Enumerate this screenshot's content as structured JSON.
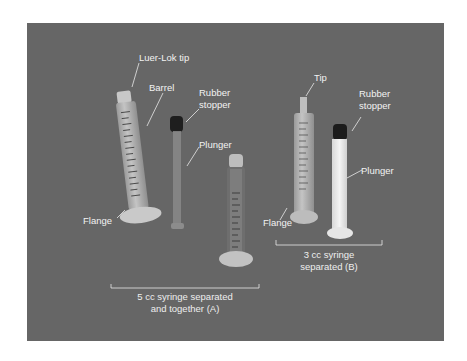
{
  "figure": {
    "background_color": "#ffffff",
    "photo_background_color": "#666666",
    "labels": {
      "luer_lok_tip": "Luer-Lok tip",
      "barrel": "Barrel",
      "rubber_stopper_a": "Rubber",
      "rubber_stopper_a_2": "stopper",
      "plunger_a": "Plunger",
      "flange_a": "Flange",
      "tip": "Tip",
      "rubber_stopper_b": "Rubber",
      "rubber_stopper_b_2": "stopper",
      "plunger_b": "Plunger",
      "flange_b": "Flange"
    },
    "captions": {
      "a_line1": "5 cc syringe separated",
      "a_line2": "and together (A)",
      "b_line1": "3 cc syringe",
      "b_line2": "separated (B)"
    }
  }
}
